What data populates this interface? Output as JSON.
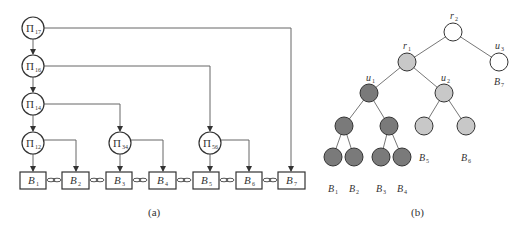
{
  "panel_a": {
    "caption": "(a)",
    "nodes": [
      {
        "id": "P17",
        "symbol": "Π",
        "sub": "17"
      },
      {
        "id": "P16",
        "symbol": "Π",
        "sub": "16"
      },
      {
        "id": "P14",
        "symbol": "Π",
        "sub": "14"
      },
      {
        "id": "P12",
        "symbol": "Π",
        "sub": "12"
      },
      {
        "id": "P34",
        "symbol": "Π",
        "sub": "34"
      },
      {
        "id": "P56",
        "symbol": "Π",
        "sub": "56"
      }
    ],
    "blocks": [
      {
        "letter": "B",
        "sub": "1"
      },
      {
        "letter": "B",
        "sub": "2"
      },
      {
        "letter": "B",
        "sub": "3"
      },
      {
        "letter": "B",
        "sub": "4"
      },
      {
        "letter": "B",
        "sub": "5"
      },
      {
        "letter": "B",
        "sub": "6"
      },
      {
        "letter": "B",
        "sub": "7"
      }
    ]
  },
  "panel_b": {
    "caption": "(b)",
    "labels": {
      "r2": {
        "letter": "r",
        "sub": "2"
      },
      "r1": {
        "letter": "r",
        "sub": "1"
      },
      "u3": {
        "letter": "u",
        "sub": "3"
      },
      "u1": {
        "letter": "u",
        "sub": "1"
      },
      "u2": {
        "letter": "u",
        "sub": "2"
      },
      "B7": {
        "letter": "B",
        "sub": "7"
      },
      "B5": {
        "letter": "B",
        "sub": "5"
      },
      "B6": {
        "letter": "B",
        "sub": "6"
      },
      "B1": {
        "letter": "B",
        "sub": "1"
      },
      "B2": {
        "letter": "B",
        "sub": "2"
      },
      "B3": {
        "letter": "B",
        "sub": "3"
      },
      "B4": {
        "letter": "B",
        "sub": "4"
      }
    },
    "colors": {
      "white": "#ffffff",
      "light": "#c8c8c8",
      "dark": "#7a7a7a",
      "stroke": "#333333"
    }
  }
}
